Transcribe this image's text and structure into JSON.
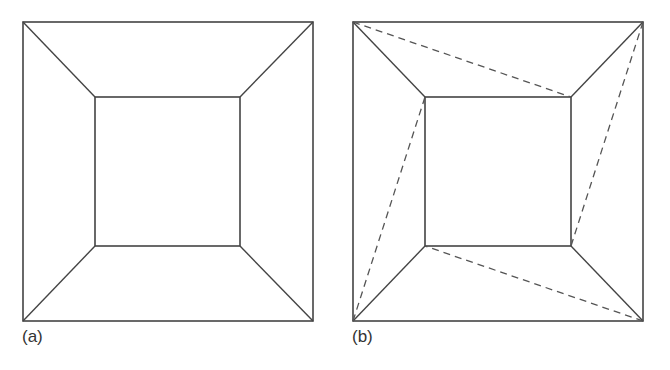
{
  "figure": {
    "stroke_color": "#444444",
    "dash_color": "#555555",
    "panels": [
      {
        "id": "a",
        "label": "(a)",
        "outer_square": {
          "x1": 23,
          "y1": 22,
          "x2": 313,
          "y2": 321
        },
        "inner_square": {
          "x1": 95,
          "y1": 97,
          "x2": 240,
          "y2": 246
        },
        "corner_connectors": "solid",
        "diagonals": []
      },
      {
        "id": "b",
        "label": "(b)",
        "outer_square": {
          "x1": 353,
          "y1": 22,
          "x2": 643,
          "y2": 321
        },
        "inner_square": {
          "x1": 425,
          "y1": 97,
          "x2": 571,
          "y2": 246
        },
        "corner_connectors": "solid",
        "diagonals": [
          {
            "from": "outer-top-left",
            "to": "inner-top-right",
            "style": "dashed"
          },
          {
            "from": "outer-top-right",
            "to": "inner-bottom-right",
            "style": "dashed"
          },
          {
            "from": "outer-bottom-right",
            "to": "inner-bottom-left",
            "style": "dashed"
          },
          {
            "from": "outer-bottom-left",
            "to": "inner-top-left",
            "style": "dashed"
          }
        ]
      }
    ]
  }
}
